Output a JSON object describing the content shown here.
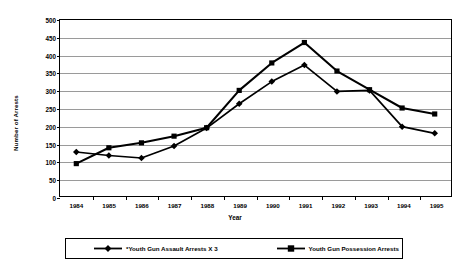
{
  "chart_data": {
    "type": "line",
    "title": "",
    "xlabel": "Year",
    "ylabel": "Number of Arrests",
    "categories": [
      "1984",
      "1985",
      "1986",
      "1987",
      "1988",
      "1989",
      "1990",
      "1991",
      "1992",
      "1993",
      "1994",
      "1995"
    ],
    "ylim": [
      0,
      500
    ],
    "yticks": [
      0,
      50,
      100,
      150,
      200,
      250,
      300,
      350,
      400,
      450,
      500
    ],
    "grid": true,
    "legend_position": "bottom",
    "series": [
      {
        "name": "*Youth Gun Assault Arrests X 3",
        "marker": "diamond",
        "color": "#000000",
        "values": [
          125,
          115,
          108,
          142,
          193,
          262,
          325,
          372,
          297,
          300,
          197,
          178
        ]
      },
      {
        "name": "Youth Gun Possession Arrests",
        "marker": "square",
        "color": "#000000",
        "values": [
          92,
          137,
          151,
          170,
          194,
          300,
          378,
          436,
          355,
          302,
          250,
          233
        ]
      }
    ]
  },
  "legend": {
    "entries": [
      {
        "label": "*Youth Gun Assault Arrests X 3"
      },
      {
        "label": "Youth Gun Possession Arrests"
      }
    ]
  },
  "axes": {
    "y_title": "Number of Arrests",
    "x_title": "Year"
  }
}
